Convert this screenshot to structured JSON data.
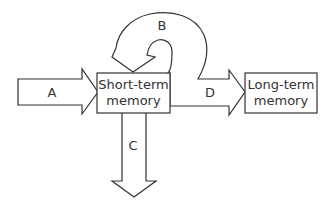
{
  "diagram": {
    "nodes": [
      {
        "id": "stm",
        "line1": "Short-term",
        "line2": "memory"
      },
      {
        "id": "ltm",
        "line1": "Long-term",
        "line2": "memory"
      }
    ],
    "arrows": {
      "A": {
        "label": "A",
        "from": "input",
        "to": "stm"
      },
      "B": {
        "label": "B",
        "from": "stm",
        "to": "stm"
      },
      "C": {
        "label": "C",
        "from": "stm",
        "to": "output"
      },
      "D": {
        "label": "D",
        "from": "stm",
        "to": "ltm"
      }
    },
    "colors": {
      "stroke": "#333333",
      "fill": "#ffffff"
    }
  }
}
